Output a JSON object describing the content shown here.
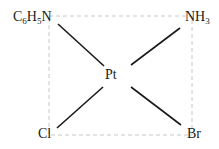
{
  "diagram": {
    "type": "square-planar coordination complex",
    "center": {
      "label": "Pt",
      "x": 113,
      "y": 75
    },
    "ligands": [
      {
        "position": "top-left",
        "label_base": "C",
        "sub1": "6",
        "mid": "H",
        "sub2": "5",
        "tail": "N",
        "text": "C6H5N",
        "x": 13,
        "y": 10
      },
      {
        "position": "top-right",
        "label_base": "NH",
        "sub1": "3",
        "text": "NH3",
        "x": 185,
        "y": 10
      },
      {
        "position": "bottom-left",
        "label_base": "Cl",
        "text": "Cl",
        "x": 38,
        "y": 127
      },
      {
        "position": "bottom-right",
        "label_base": "Br",
        "text": "Br",
        "x": 187,
        "y": 127
      }
    ],
    "bonds": [
      {
        "from": "top-left",
        "x1": 58,
        "y1": 24,
        "x2": 104,
        "y2": 66
      },
      {
        "from": "top-right",
        "x1": 180,
        "y1": 28,
        "x2": 131,
        "y2": 65
      },
      {
        "from": "bottom-left",
        "x1": 57,
        "y1": 128,
        "x2": 103,
        "y2": 87
      },
      {
        "from": "bottom-right",
        "x1": 131,
        "y1": 87,
        "x2": 181,
        "y2": 125
      }
    ],
    "guide_box": {
      "x": 49,
      "y": 16,
      "width": 143,
      "height": 119,
      "style": "dashed",
      "color": "#c8c8c8"
    },
    "colors": {
      "bond": "#1a1a1a",
      "text": "#1a1a1a",
      "guide": "#c8c8c8"
    }
  }
}
